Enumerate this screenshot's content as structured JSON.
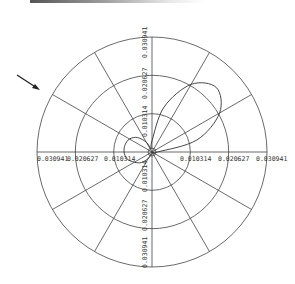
{
  "chart_data": {
    "type": "polar",
    "title": "",
    "radial_ticks": [
      "0.010314",
      "0.020627",
      "0.030941"
    ],
    "radial_values": [
      0.010314,
      0.020627,
      0.030941
    ],
    "rmax": 0.030941,
    "angular_spokes_deg": [
      0,
      30,
      60,
      90,
      120,
      150,
      180,
      210,
      240,
      270,
      300,
      330
    ],
    "grid": true,
    "series": [
      {
        "name": "pattern",
        "description": "main lobe toward ~45deg reaching ~0.024, small back lobe toward ~200deg",
        "theta_deg": [
          0,
          15,
          30,
          45,
          60,
          75,
          90,
          105,
          120,
          135,
          150,
          165,
          180,
          195,
          210,
          225,
          240,
          255,
          270,
          285,
          300,
          315,
          330,
          345,
          360
        ],
        "r": [
          0.0015,
          0.0125,
          0.021,
          0.0245,
          0.021,
          0.0125,
          0.003,
          0.001,
          0.003,
          0.0055,
          0.007,
          0.0075,
          0.0075,
          0.007,
          0.0055,
          0.004,
          0.002,
          0.0008,
          0.0005,
          0.0004,
          0.0003,
          0.0002,
          0.0003,
          0.0006,
          0.0015
        ]
      }
    ],
    "annotations": [
      {
        "type": "arrow",
        "direction": "down-right",
        "position": "upper-left"
      }
    ]
  },
  "labels": {
    "top_outer": "0.030941",
    "top_mid": "0.020627",
    "top_inner": "0.010314",
    "left_outer": "0.030941",
    "left_mid": "0.020627",
    "left_inner": "0.010314",
    "right_inner": "0.010314",
    "right_mid": "0.020627",
    "right_outer": "0.030941",
    "bottom_inner": "0.010314",
    "bottom_mid": "0.020627",
    "bottom_outer": "0.030941"
  }
}
